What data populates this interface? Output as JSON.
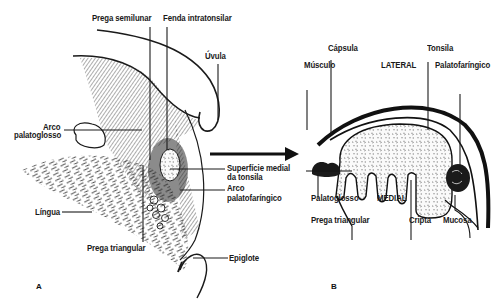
{
  "figure": {
    "panel_a": {
      "letter": "A",
      "labels": {
        "prega_semilunar": "Prega semilunar",
        "fenda_intratonsilar": "Fenda intratonsilar",
        "uvula": "Úvula",
        "arco_palatoglosso_1": "Arco",
        "arco_palatoglosso_2": "palatoglosso",
        "superficie_medial_1": "Superfície medial",
        "superficie_medial_2": "da tonsila",
        "arco_palatofaringico_1": "Arco",
        "arco_palatofaringico_2": "palatofaríngico",
        "lingua": "Língua",
        "prega_triangular": "Prega triangular",
        "epiglote": "Epiglote"
      }
    },
    "panel_b": {
      "letter": "B",
      "labels": {
        "capsula": "Cápsula",
        "musculo": "Músculo",
        "lateral": "LATERAL",
        "tonsila": "Tonsila",
        "palatofaringico": "Palatofaríngico",
        "palatoglosso": "Palatoglosso",
        "medial": "MEDIAL",
        "prega_triangular": "Prega triangular",
        "cripta": "Cripta",
        "mucosa": "Mucosa"
      }
    },
    "colors": {
      "ink": "#1a1a1a",
      "background": "#ffffff",
      "tissue_fill": "#f2f2f2"
    }
  }
}
